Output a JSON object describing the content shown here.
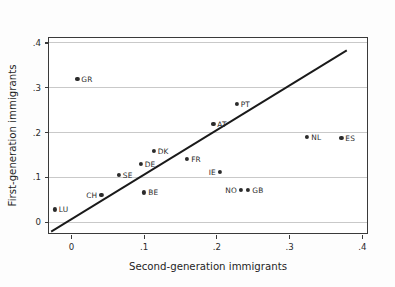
{
  "chart_data": {
    "type": "scatter",
    "title": "",
    "xlabel": "Second-generation immigrants",
    "ylabel": "First-generation immigrants",
    "xlim": [
      -0.03,
      0.41
    ],
    "ylim": [
      -0.03,
      0.41
    ],
    "xticks": [
      0,
      0.1,
      0.2,
      0.3,
      0.4
    ],
    "xtick_labels": [
      "0",
      ".1",
      ".2",
      ".3",
      ".4"
    ],
    "yticks": [
      0,
      0.1,
      0.2,
      0.3,
      0.4
    ],
    "ytick_labels": [
      "0",
      ".1",
      ".2",
      ".3",
      ".4"
    ],
    "grid": "horizontal",
    "legend": "none",
    "reference_line": {
      "name": "45-degree identity line",
      "type": "line",
      "x": [
        -0.027,
        0.382
      ],
      "y": [
        -0.027,
        0.382
      ]
    },
    "points": [
      {
        "label": "GR",
        "x": 0.009,
        "y": 0.318,
        "label_side": "right"
      },
      {
        "label": "PT",
        "x": 0.228,
        "y": 0.263,
        "label_side": "right"
      },
      {
        "label": "AT",
        "x": 0.196,
        "y": 0.219,
        "label_side": "right"
      },
      {
        "label": "NL",
        "x": 0.325,
        "y": 0.189,
        "label_side": "right"
      },
      {
        "label": "ES",
        "x": 0.372,
        "y": 0.187,
        "label_side": "right"
      },
      {
        "label": "DK",
        "x": 0.114,
        "y": 0.158,
        "label_side": "right"
      },
      {
        "label": "FR",
        "x": 0.16,
        "y": 0.14,
        "label_side": "right"
      },
      {
        "label": "DE",
        "x": 0.096,
        "y": 0.128,
        "label_side": "right"
      },
      {
        "label": "IE",
        "x": 0.205,
        "y": 0.111,
        "label_side": "left"
      },
      {
        "label": "SE",
        "x": 0.066,
        "y": 0.105,
        "label_side": "right"
      },
      {
        "label": "NO",
        "x": 0.234,
        "y": 0.071,
        "label_side": "left"
      },
      {
        "label": "GB",
        "x": 0.244,
        "y": 0.071,
        "label_side": "right"
      },
      {
        "label": "CH",
        "x": 0.042,
        "y": 0.06,
        "label_side": "left"
      },
      {
        "label": "BE",
        "x": 0.101,
        "y": 0.065,
        "label_side": "right"
      },
      {
        "label": "LU",
        "x": -0.022,
        "y": 0.027,
        "label_side": "right"
      }
    ]
  },
  "colors": {
    "point": "#2b2b2b",
    "line": "#1a1a1a",
    "grid": "#c9c9c9",
    "frame": "#3a3a3a",
    "background": "#fdfdfd",
    "plot_background": "#ffffff"
  }
}
